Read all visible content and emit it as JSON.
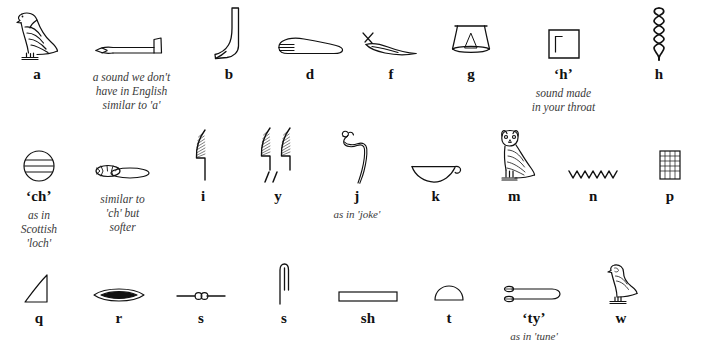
{
  "document": {
    "title": "Egyptian Hieroglyph Alphabet Chart",
    "ink_color": "#111111",
    "note_color": "#3a3a3a",
    "background": "#ffffff"
  },
  "rows": [
    {
      "id": "row-1",
      "cells": [
        {
          "glyph": "vulture-glyph",
          "letter": "a",
          "note": ""
        },
        {
          "glyph": "forearm-glyph",
          "letter": "",
          "note": "a sound we don't\nhave in English\nsimilar to 'a'"
        },
        {
          "glyph": "foot-leg-glyph",
          "letter": "b",
          "note": ""
        },
        {
          "glyph": "hand-glyph",
          "letter": "d",
          "note": ""
        },
        {
          "glyph": "horned-viper-glyph",
          "letter": "f",
          "note": ""
        },
        {
          "glyph": "jar-stand-glyph",
          "letter": "g",
          "note": ""
        },
        {
          "glyph": "reed-shelter-glyph",
          "letter": "‘h’",
          "note": "sound made\nin your throat"
        },
        {
          "glyph": "twisted-flax-glyph",
          "letter": "h",
          "note": ""
        }
      ]
    },
    {
      "id": "row-2",
      "cells": [
        {
          "glyph": "placenta-glyph",
          "letter": "‘ch’",
          "note": "as in\nScottish\n'loch'"
        },
        {
          "glyph": "animal-belly-glyph",
          "letter": "",
          "note": "similar to\n'ch' but\nsofter"
        },
        {
          "glyph": "reed-leaf-glyph",
          "letter": "i",
          "note": ""
        },
        {
          "glyph": "double-reed-glyph",
          "letter": "y",
          "note": ""
        },
        {
          "glyph": "cobra-glyph",
          "letter": "j",
          "note": "as in 'joke'"
        },
        {
          "glyph": "basket-glyph",
          "letter": "k",
          "note": ""
        },
        {
          "glyph": "owl-glyph",
          "letter": "m",
          "note": ""
        },
        {
          "glyph": "water-ripple-glyph",
          "letter": "n",
          "note": ""
        },
        {
          "glyph": "stool-glyph",
          "letter": "p",
          "note": ""
        }
      ]
    },
    {
      "id": "row-3",
      "cells": [
        {
          "glyph": "hill-slope-glyph",
          "letter": "q",
          "note": ""
        },
        {
          "glyph": "mouth-glyph",
          "letter": "r",
          "note": ""
        },
        {
          "glyph": "door-bolt-glyph",
          "letter": "s",
          "note": ""
        },
        {
          "glyph": "folded-cloth-glyph",
          "letter": "s",
          "note": ""
        },
        {
          "glyph": "pool-glyph",
          "letter": "sh",
          "note": ""
        },
        {
          "glyph": "bread-loaf-glyph",
          "letter": "t",
          "note": ""
        },
        {
          "glyph": "tethering-rope-glyph",
          "letter": "‘ty’",
          "note": "as in 'tune'"
        },
        {
          "glyph": "quail-chick-glyph",
          "letter": "w",
          "note": ""
        }
      ]
    }
  ]
}
